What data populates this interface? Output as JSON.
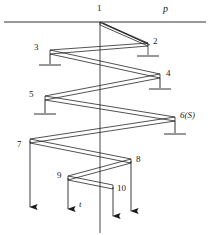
{
  "diagram": {
    "stroke_color": "#1a1a1a",
    "background_color": "#ffffff",
    "axis_label": "t",
    "boundary_label": "p",
    "boundary_line": {
      "y": 22,
      "x_start": 4,
      "x_end": 206
    },
    "vertical_axis": {
      "x": 100,
      "y_start": 22,
      "y_end": 233
    },
    "nodes": [
      {
        "id": "1",
        "label": "1",
        "x": 100,
        "y": 22,
        "label_x": 97,
        "label_y": 6,
        "ground": false,
        "side": "top"
      },
      {
        "id": "2",
        "label": "2",
        "x": 148,
        "y": 43,
        "label_x": 153,
        "label_y": 38,
        "ground": true,
        "side": "right"
      },
      {
        "id": "3",
        "label": "3",
        "x": 50,
        "y": 52,
        "label_x": 34,
        "label_y": 45,
        "ground": true,
        "side": "left"
      },
      {
        "id": "4",
        "label": "4",
        "x": 160,
        "y": 76,
        "label_x": 166,
        "label_y": 71,
        "ground": true,
        "side": "right"
      },
      {
        "id": "5",
        "label": "5",
        "x": 45,
        "y": 98,
        "label_x": 29,
        "label_y": 92,
        "ground": true,
        "side": "left"
      },
      {
        "id": "6",
        "label": "6(S)",
        "x": 175,
        "y": 119,
        "label_x": 180,
        "label_y": 114,
        "ground": true,
        "side": "right"
      },
      {
        "id": "7",
        "label": "7",
        "x": 30,
        "y": 141,
        "label_x": 17,
        "label_y": 142,
        "ground": false,
        "side": "left"
      },
      {
        "id": "8",
        "label": "8",
        "x": 131,
        "y": 161,
        "label_x": 136,
        "label_y": 157,
        "ground": false,
        "side": "right"
      },
      {
        "id": "9",
        "label": "9",
        "x": 68,
        "y": 178,
        "label_x": 57,
        "label_y": 173,
        "ground": false,
        "side": "left"
      },
      {
        "id": "10",
        "label": "10",
        "x": 113,
        "y": 187,
        "label_x": 117,
        "label_y": 186,
        "ground": false,
        "side": "right"
      }
    ],
    "arrows": [
      {
        "name": "arrow-node-7",
        "x": 30,
        "y_start": 141,
        "y_end": 207
      },
      {
        "name": "arrow-node-9",
        "x": 68,
        "y_start": 178,
        "y_end": 209
      },
      {
        "name": "arrow-node-10",
        "x": 113,
        "y_start": 187,
        "y_end": 216
      },
      {
        "name": "arrow-node-8",
        "x": 131,
        "y_start": 161,
        "y_end": 211
      }
    ],
    "axis_label_pos": {
      "x": 79,
      "y": 203
    },
    "boundary_label_pos": {
      "x": 163,
      "y": 6
    }
  }
}
